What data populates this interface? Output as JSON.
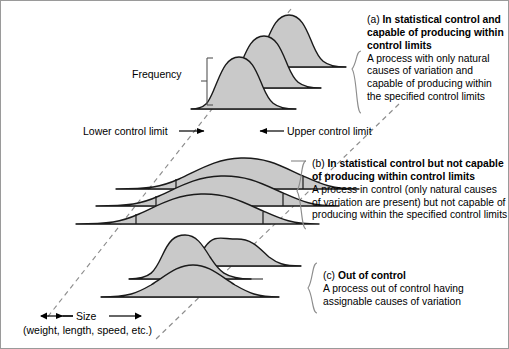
{
  "figure": {
    "axis_labels": {
      "frequency": "Frequency",
      "size": "Size",
      "size_units": "(weight, length, speed, etc.)"
    },
    "limits": {
      "lower": "Lower control limit",
      "upper": "Upper control limit"
    },
    "colors": {
      "curve_fill": "#c9c9c9",
      "curve_stroke": "#1a1a1a",
      "dashed_line": "#8d8d8d",
      "bracket": "#8d8d8d",
      "text": "#000000",
      "border": "#9a9a9a",
      "background": "#ffffff"
    },
    "panels": [
      {
        "tag": "(a)",
        "heading": "In statistical control and capable of producing within control limits",
        "body": "A process with only natural causes of variation and capable of producing within the specified control limits"
      },
      {
        "tag": "(b)",
        "heading": "In statistical control but not capable of producing within control limits",
        "body": "A process in control (only natural causes of variation are present) but not capable of producing within the specified control limits"
      },
      {
        "tag": "(c)",
        "heading": "Out of control",
        "body": "A process out of control having assignable causes of variation"
      }
    ]
  }
}
